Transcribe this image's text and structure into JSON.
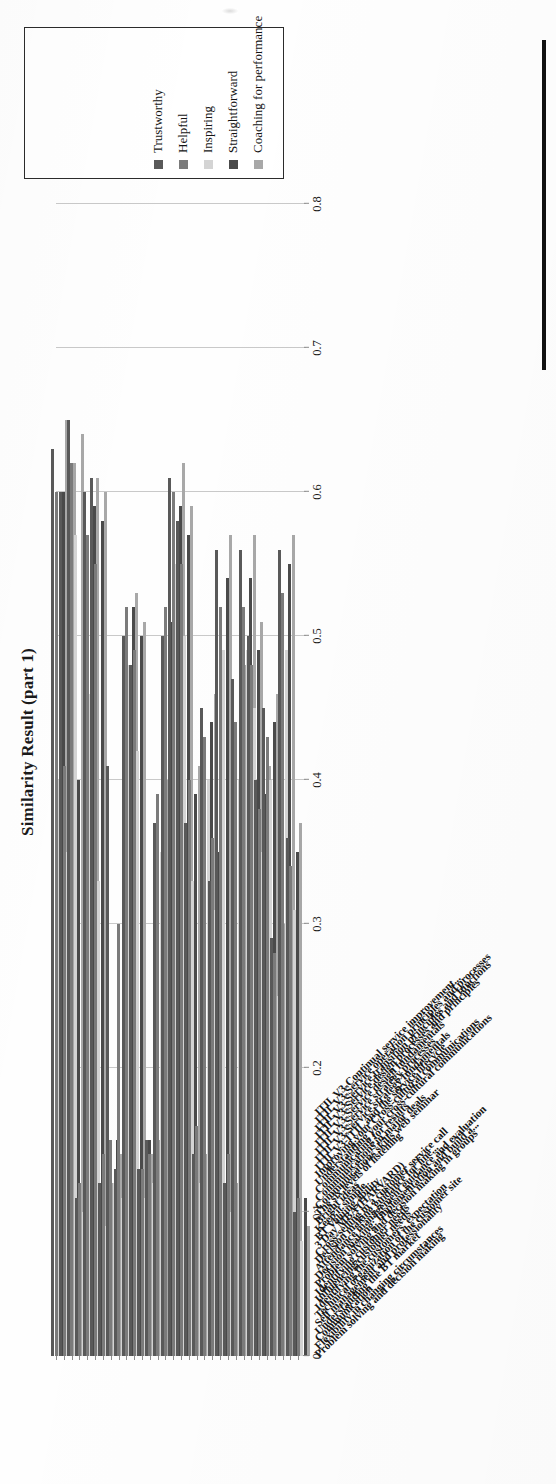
{
  "figure": {
    "title": "Similarity Result (part 1)"
  },
  "legend": {
    "items": [
      {
        "label": "Trustworthy",
        "color": "#595959"
      },
      {
        "label": "Helpful",
        "color": "#7b7b7b"
      },
      {
        "label": "Inspiring",
        "color": "#d4d4d4"
      },
      {
        "label": "Straightforward",
        "color": "#4a4a4a"
      },
      {
        "label": "Coaching for performance",
        "color": "#a8a8a8"
      }
    ]
  },
  "axis": {
    "value_ticks": [
      "0",
      "0.1",
      "0.2",
      "0.3",
      "0.4",
      "0.5",
      "0.6",
      "0.7",
      "0.8"
    ],
    "min": 0,
    "max": 0.8
  },
  "chart_data": {
    "type": "bar",
    "title": "Similarity Result (part 1)",
    "xlabel": "",
    "ylabel": "",
    "ylim": [
      0,
      0.8
    ],
    "grid": true,
    "legend_position": "right",
    "orientation": "vertical-rotated",
    "categories": [
      "Problem solving and decision making",
      "Flexibility in changing circumstances",
      "Communication",
      "Understanding the BT market",
      "Self management and professionality",
      "Technical organization of the customer site",
      "Identifying the customers' expectation",
      "Influencing customer needs",
      "Identifying customer needs",
      "Problem solving and decision making in groups",
      "Decision making: Implementation and build a...",
      "Attendance management guidance and evaluation",
      "Decision making guidance for line...",
      "Cross-selling in a customer service call",
      "3 Day MBA (HARVARD)",
      "BT Valuing ability",
      "Keep it simple",
      "Bright ideas",
      "The six levels of listening",
      "Communications skills web seminar",
      "Communications in major deals",
      "Communicating for results",
      "Understanding your cross-cultural communications",
      "Improving your Cross-cultural communications",
      "ITIL V3-ITIL and the service lifecycle",
      "ITIL V3-Service strategy fundamentals",
      "ITIL V3-Service strategy processes",
      "ITIL V3-Service design fundamentals",
      "ITIL V3-Service design processes and principles",
      "ITIL V3-Service transition principles and functions",
      "ITIL V3-Service operation principles and processes",
      "ITIL V3-Continual service improvement..."
    ],
    "series": [
      {
        "name": "Trustworthy",
        "color": "#595959",
        "values": [
          0.63,
          0.6,
          0.65,
          0.11,
          0.6,
          0.61,
          0.12,
          0.41,
          0.13,
          0.5,
          0.48,
          0.13,
          0.15,
          0.37,
          0.5,
          0.61,
          0.58,
          0.37,
          0.14,
          0.45,
          0.33,
          0.56,
          0.12,
          0.47,
          0.56,
          0.5,
          0.4,
          0.45,
          0.29,
          0.56,
          0.36,
          0.1
        ]
      },
      {
        "name": "Helpful",
        "color": "#7b7b7b",
        "values": [
          0.6,
          0.41,
          0.62,
          0.12,
          0.57,
          0.55,
          0.14,
          0.15,
          0.3,
          0.52,
          0.49,
          0.13,
          0.14,
          0.39,
          0.52,
          0.6,
          0.55,
          0.4,
          0.16,
          0.43,
          0.36,
          0.52,
          0.14,
          0.44,
          0.52,
          0.48,
          0.38,
          0.43,
          0.28,
          0.53,
          0.34,
          0.11
        ]
      },
      {
        "name": "Inspiring",
        "color": "#d4d4d4",
        "values": [
          0.4,
          0.35,
          0.57,
          0.1,
          0.46,
          0.33,
          0.09,
          0.12,
          0.11,
          0.48,
          0.42,
          0.11,
          0.12,
          0.35,
          0.47,
          0.55,
          0.5,
          0.33,
          0.12,
          0.4,
          0.31,
          0.49,
          0.1,
          0.4,
          0.49,
          0.45,
          0.35,
          0.4,
          0.25,
          0.49,
          0.31,
          0.08
        ]
      },
      {
        "name": "Straightforward",
        "color": "#4a4a4a",
        "values": [
          0.6,
          0.6,
          0.4,
          0.13,
          0.59,
          0.58,
          0.13,
          0.15,
          0.16,
          0.52,
          0.5,
          0.15,
          0.16,
          0.38,
          0.51,
          0.59,
          0.57,
          0.39,
          0.15,
          0.44,
          0.35,
          0.54,
          0.13,
          0.45,
          0.54,
          0.49,
          0.39,
          0.44,
          0.27,
          0.55,
          0.35,
          0.11
        ]
      },
      {
        "name": "Coaching for performance",
        "color": "#a8a8a8",
        "values": [
          0.65,
          0.62,
          0.64,
          0.12,
          0.61,
          0.6,
          0.12,
          0.14,
          0.13,
          0.53,
          0.51,
          0.14,
          0.15,
          0.4,
          0.53,
          0.62,
          0.59,
          0.41,
          0.14,
          0.46,
          0.37,
          0.57,
          0.12,
          0.48,
          0.57,
          0.51,
          0.41,
          0.46,
          0.3,
          0.57,
          0.37,
          0.09
        ]
      }
    ]
  }
}
